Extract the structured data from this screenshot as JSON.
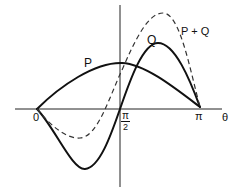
{
  "diagram": {
    "axis_label_theta": "θ",
    "ticks": {
      "zero": "0",
      "half_pi_num": "π",
      "half_pi_den": "2",
      "pi": "π"
    },
    "curves": [
      {
        "name": "P",
        "label": "P",
        "style": "solid"
      },
      {
        "name": "Q",
        "label": "Q",
        "style": "solid"
      },
      {
        "name": "P+Q",
        "label": "P + Q",
        "style": "dashed"
      }
    ]
  }
}
